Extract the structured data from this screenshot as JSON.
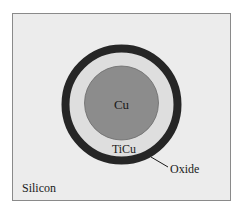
{
  "diagram": {
    "labels": {
      "core": "Cu",
      "liner": "TiCu",
      "shell": "Oxide",
      "substrate": "Silicon"
    },
    "colors": {
      "background": "#ffffff",
      "substrate": "#ececec",
      "frame_border": "#8a8a8a",
      "oxide": "#262626",
      "ticu": "#dedede",
      "cu": "#8c8c8c",
      "cu_edge": "#6a6a6a",
      "text": "#1a1a1a"
    },
    "geometry": {
      "center": [
        121.5,
        104.5
      ],
      "oxide_outer_radius": 60,
      "oxide_thickness": 8,
      "cu_radius": 37
    }
  }
}
